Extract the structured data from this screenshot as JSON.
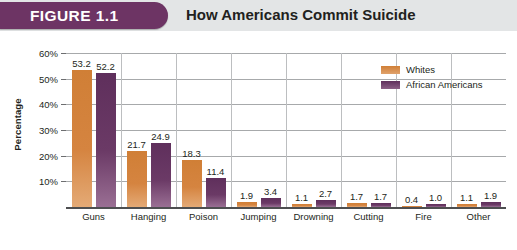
{
  "header": {
    "badge_label": "FIGURE 1.1",
    "title": "How Americans Commit Suicide",
    "badge_color": "#6d3464",
    "band_color": "#e3e5e6"
  },
  "chart_data": {
    "type": "bar",
    "title": "How Americans Commit Suicide",
    "xlabel": "",
    "ylabel": "Percentage",
    "ylim": [
      0,
      60
    ],
    "ytick_labels": [
      "10%",
      "20%",
      "30%",
      "40%",
      "50%",
      "60%"
    ],
    "ytick_values": [
      10,
      20,
      30,
      40,
      50,
      60
    ],
    "grid": true,
    "legend_position": "top-right",
    "categories": [
      "Guns",
      "Hanging",
      "Poison",
      "Jumping",
      "Drowning",
      "Cutting",
      "Fire",
      "Other"
    ],
    "series": [
      {
        "name": "Whites",
        "color": "#d07f36",
        "values": [
          53.2,
          21.7,
          18.3,
          1.9,
          1.1,
          1.7,
          0.4,
          1.1
        ],
        "labels": [
          "53.2",
          "21.7",
          "18.3",
          "1.9",
          "1.1",
          "1.7",
          "0.4",
          "1.1"
        ]
      },
      {
        "name": "African Americans",
        "color": "#6b3a66",
        "values": [
          52.2,
          24.9,
          11.4,
          3.4,
          2.7,
          1.7,
          1.0,
          1.9
        ],
        "labels": [
          "52.2",
          "24.9",
          "11.4",
          "3.4",
          "2.7",
          "1.7",
          "1.0",
          "1.9"
        ]
      }
    ]
  }
}
